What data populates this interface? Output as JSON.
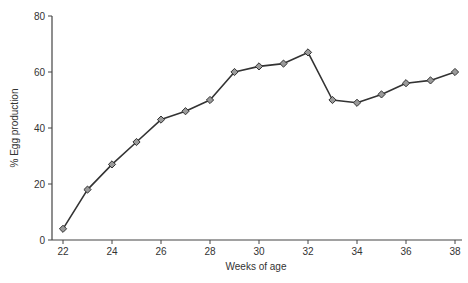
{
  "chart_data": {
    "type": "line",
    "title": "",
    "xlabel": "Weeks of age",
    "ylabel": "% Egg production",
    "x": [
      22,
      23,
      24,
      25,
      26,
      27,
      28,
      29,
      30,
      31,
      32,
      33,
      34,
      35,
      36,
      37,
      38
    ],
    "series": [
      {
        "name": "Egg production",
        "values": [
          4,
          18,
          27,
          35,
          43,
          46,
          50,
          60,
          62,
          63,
          67,
          50,
          49,
          52,
          56,
          57,
          60
        ]
      }
    ],
    "xticks": [
      22,
      24,
      26,
      28,
      30,
      32,
      34,
      36,
      38
    ],
    "yticks": [
      0,
      20,
      40,
      60,
      80
    ],
    "xlim": [
      21.5,
      38.3
    ],
    "ylim": [
      0,
      80
    ],
    "grid": false,
    "legend": "none",
    "marker": "diamond"
  },
  "colors": {
    "line": "#333333",
    "marker_fill": "#9a9a9a",
    "marker_stroke": "#333333",
    "axis": "#444444"
  }
}
